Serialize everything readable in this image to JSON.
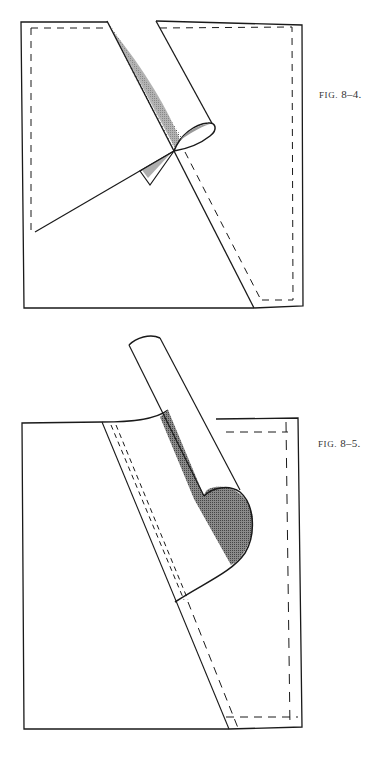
{
  "figures": [
    {
      "id": "fig-8-4",
      "caption_prefix": "FIG.",
      "caption_number": "8–4.",
      "description": "Square with dashed seam allowance; a corner strip is being rolled diagonally, shaded underside visible, forming a small twisted fold near center"
    },
    {
      "id": "fig-8-5",
      "caption_prefix": "FIG.",
      "caption_number": "8–5.",
      "description": "Square with diagonal rolled strip lifted above the top edge; shaded underside with rounded lobe; double dashed stitching lines along the fold"
    }
  ],
  "colors": {
    "line": "#1a1a1a",
    "shade": "#8a8a8a",
    "background": "#ffffff"
  }
}
